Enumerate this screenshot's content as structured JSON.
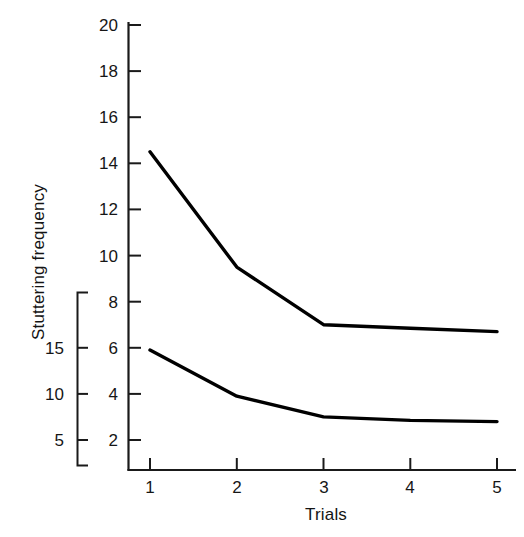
{
  "chart_data": {
    "type": "line",
    "title": "",
    "subtitle": "",
    "xlabel": "Trials",
    "ylabel": "Stuttering frequency",
    "x": [
      1,
      2,
      3,
      4,
      5
    ],
    "categories": [
      "1",
      "2",
      "3",
      "4",
      "5"
    ],
    "xlim": [
      0.72,
      5.05
    ],
    "ylim": [
      0,
      20.6
    ],
    "xticks": [
      1,
      2,
      3,
      4,
      5
    ],
    "xtick_labels": [
      "1",
      "2",
      "3",
      "4",
      "5"
    ],
    "yticks": [
      2,
      4,
      6,
      8,
      10,
      12,
      14,
      16,
      18,
      20
    ],
    "ytick_labels": [
      "2",
      "4",
      "6",
      "8",
      "10",
      "12",
      "14",
      "16",
      "18",
      "20"
    ],
    "grid": false,
    "legend": false,
    "legend_position": "none",
    "line_color": "#000000",
    "background_color": "#ffffff",
    "axis_color": "#1a1a1a",
    "series": [
      {
        "name": "upper-curve",
        "values": [
          14.5,
          9.5,
          7.0,
          6.85,
          6.7
        ]
      },
      {
        "name": "lower-curve",
        "values": [
          5.9,
          3.9,
          3.0,
          2.85,
          2.8
        ]
      }
    ],
    "secondary_scale": {
      "name": "bracketed-scale",
      "ticks": [
        15,
        10,
        5
      ],
      "tick_labels": [
        "15",
        "10",
        "5"
      ],
      "range": [
        0,
        20.6
      ]
    },
    "annotations": []
  },
  "axes": {
    "x_title": "Trials",
    "y_title": "Stuttering frequency"
  }
}
